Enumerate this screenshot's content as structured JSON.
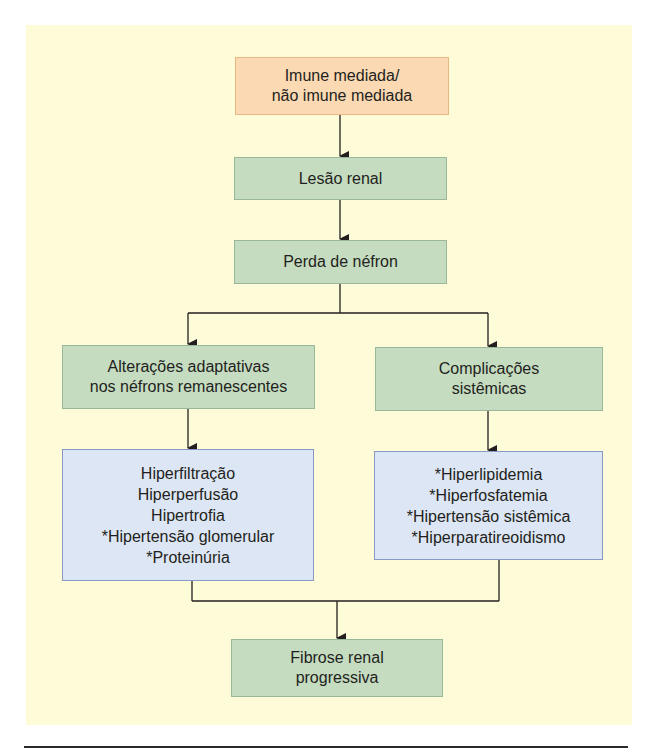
{
  "diagram": {
    "nodes": {
      "cause": {
        "lines": [
          "Imune mediada/",
          "não imune mediada"
        ],
        "color": "#fbd9b2"
      },
      "renal_injury": {
        "lines": [
          "Lesão renal"
        ],
        "color": "#c5dcc0"
      },
      "nephron_loss": {
        "lines": [
          "Perda de néfron"
        ],
        "color": "#c5dcc0"
      },
      "adaptive_changes": {
        "lines": [
          "Alterações adaptativas",
          "nos néfrons remanescentes"
        ],
        "color": "#c5dcc0"
      },
      "systemic_complications": {
        "lines": [
          "Complicações",
          "sistêmicas"
        ],
        "color": "#c5dcc0"
      },
      "adaptive_list": {
        "lines": [
          "Hiperfiltração",
          "Hiperperfusão",
          "Hipertrofia",
          "*Hipertensão glomerular",
          "*Proteinúria"
        ],
        "color": "#dde6f4"
      },
      "systemic_list": {
        "lines": [
          "*Hiperlipidemia",
          "*Hiperfosfatemia",
          "*Hipertensão sistêmica",
          "*Hiperparatireoidismo"
        ],
        "color": "#dde6f4"
      },
      "outcome": {
        "lines": [
          "Fibrose renal",
          "progressiva"
        ],
        "color": "#c5dcc0"
      }
    },
    "edges": [
      [
        "cause",
        "renal_injury"
      ],
      [
        "renal_injury",
        "nephron_loss"
      ],
      [
        "nephron_loss",
        "adaptive_changes"
      ],
      [
        "nephron_loss",
        "systemic_complications"
      ],
      [
        "adaptive_changes",
        "adaptive_list"
      ],
      [
        "systemic_complications",
        "systemic_list"
      ],
      [
        "adaptive_list",
        "outcome"
      ],
      [
        "systemic_list",
        "outcome"
      ]
    ],
    "panel_color": "#fefbd8"
  }
}
